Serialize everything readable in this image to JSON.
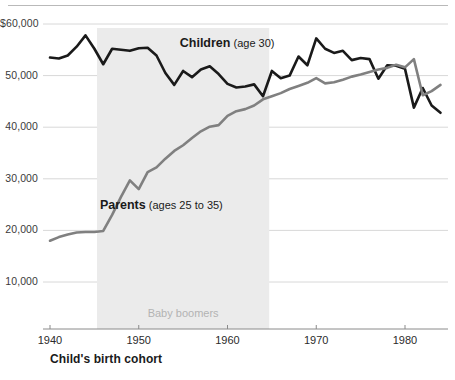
{
  "chart_data": {
    "type": "line",
    "title": "",
    "subtitle": "",
    "xlabel": "Child's birth cohort",
    "ylabel": "",
    "xlim": [
      1939,
      1985
    ],
    "ylim": [
      0,
      62000
    ],
    "grid": true,
    "legend_position": "inline-annotations",
    "y_ticks": [
      {
        "value": 60000,
        "label": "$60,000"
      },
      {
        "value": 50000,
        "label": "50,000"
      },
      {
        "value": 40000,
        "label": "40,000"
      },
      {
        "value": 30000,
        "label": "30,000"
      },
      {
        "value": 20000,
        "label": "20,000"
      },
      {
        "value": 10000,
        "label": "10,000"
      }
    ],
    "x_ticks": [
      {
        "value": 1940,
        "label": "1940"
      },
      {
        "value": 1950,
        "label": "1950"
      },
      {
        "value": 1960,
        "label": "1960"
      },
      {
        "value": 1970,
        "label": "1970"
      },
      {
        "value": 1980,
        "label": "1980"
      }
    ],
    "annotations": [
      {
        "name": "children-label",
        "main": "Children",
        "sub": "(age 30)",
        "x": 1958,
        "y": 56200
      },
      {
        "name": "parents-label",
        "main": "Parents",
        "sub": "(ages 25 to 35)",
        "x": 1949,
        "y": 24800
      }
    ],
    "shaded_regions": [
      {
        "name": "baby-boomers-band",
        "label": "Baby boomers",
        "x_start": 1945.3,
        "x_end": 1964.7,
        "color": "#ebebeb",
        "label_x": 1955,
        "label_y": 3600
      }
    ],
    "series": [
      {
        "name": "Children",
        "color": "#1a1a1a",
        "width": 2.6,
        "x": [
          1940,
          1941,
          1942,
          1943,
          1944,
          1945,
          1946,
          1947,
          1948,
          1949,
          1950,
          1951,
          1952,
          1953,
          1954,
          1955,
          1956,
          1957,
          1958,
          1959,
          1960,
          1961,
          1962,
          1963,
          1964,
          1965,
          1966,
          1967,
          1968,
          1969,
          1970,
          1971,
          1972,
          1973,
          1974,
          1975,
          1976,
          1977,
          1978,
          1979,
          1980,
          1981,
          1982,
          1983,
          1984
        ],
        "values": [
          53500,
          53300,
          53900,
          55600,
          57800,
          55200,
          52200,
          55200,
          55000,
          54800,
          55300,
          55400,
          53900,
          50500,
          48200,
          50900,
          49700,
          51200,
          51800,
          50300,
          48400,
          47700,
          47900,
          48300,
          46000,
          50900,
          49500,
          50000,
          53700,
          52000,
          57200,
          55200,
          54400,
          54800,
          53000,
          53400,
          53200,
          49400,
          52000,
          51900,
          51300,
          43800,
          47600,
          44200,
          42800
        ]
      },
      {
        "name": "Parents",
        "color": "#808080",
        "width": 2.6,
        "x": [
          1940,
          1941,
          1942,
          1943,
          1944,
          1945,
          1946,
          1947,
          1948,
          1949,
          1950,
          1951,
          1952,
          1953,
          1954,
          1955,
          1956,
          1957,
          1958,
          1959,
          1960,
          1961,
          1962,
          1963,
          1964,
          1965,
          1966,
          1967,
          1968,
          1969,
          1970,
          1971,
          1972,
          1973,
          1974,
          1975,
          1976,
          1977,
          1978,
          1979,
          1980,
          1981,
          1982,
          1983,
          1984
        ],
        "values": [
          18000,
          18700,
          19200,
          19600,
          19700,
          19700,
          19900,
          23000,
          26500,
          29700,
          28000,
          31300,
          32200,
          33900,
          35400,
          36500,
          37900,
          39200,
          40100,
          40400,
          42200,
          43100,
          43500,
          44200,
          45400,
          46000,
          46600,
          47400,
          48000,
          48600,
          49500,
          48500,
          48700,
          49200,
          49800,
          50200,
          50700,
          51200,
          51500,
          52100,
          51600,
          53200,
          46200,
          47000,
          48200
        ]
      }
    ]
  },
  "axis_title": {
    "x": "Child's birth cohort"
  }
}
